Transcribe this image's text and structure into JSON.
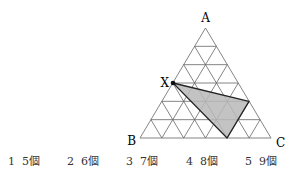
{
  "diagram": {
    "type": "triangular-grid",
    "divisions": 6,
    "vertices": {
      "A": {
        "label": "A",
        "x": 205.5,
        "y": 28
      },
      "B": {
        "label": "B",
        "x": 140,
        "y": 138
      },
      "C": {
        "label": "C",
        "x": 271,
        "y": 138
      }
    },
    "point_X": {
      "label": "X",
      "x": 173,
      "y": 83
    },
    "shaded_triangle": [
      [
        173,
        83
      ],
      [
        249,
        101.3
      ],
      [
        227,
        138
      ]
    ],
    "colors": {
      "grid": "#666666",
      "shade": "#b8b8b8",
      "outline": "#222222"
    }
  },
  "choices": [
    {
      "num": "1",
      "text": "5個"
    },
    {
      "num": "2",
      "text": "6個"
    },
    {
      "num": "3",
      "text": "7個"
    },
    {
      "num": "4",
      "text": "8個"
    },
    {
      "num": "5",
      "text": "9個"
    }
  ]
}
